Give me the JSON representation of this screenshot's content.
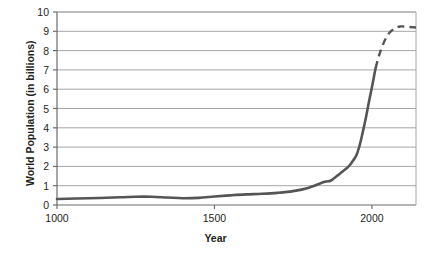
{
  "chart_data": {
    "type": "line",
    "title": "",
    "xlabel": "Year",
    "ylabel": "World Population (in billions)",
    "xlim": [
      1000,
      2140
    ],
    "ylim": [
      0,
      10
    ],
    "grid": true,
    "legend": "none",
    "line_color": "#555555",
    "grid_color": "#a6a6a6",
    "axis_color": "#808080",
    "x_ticks": [
      1000,
      1500,
      2000
    ],
    "x_tick_labels": [
      "1000",
      "1500",
      "2000"
    ],
    "y_ticks": [
      0,
      1,
      2,
      3,
      4,
      5,
      6,
      7,
      8,
      9,
      10
    ],
    "y_tick_labels": [
      "0",
      "1",
      "2",
      "3",
      "4",
      "5",
      "6",
      "7",
      "8",
      "9",
      "10"
    ],
    "series": [
      {
        "name": "Historical world population",
        "style": "solid",
        "x": [
          1000,
          1100,
          1200,
          1250,
          1300,
          1350,
          1400,
          1450,
          1500,
          1550,
          1600,
          1650,
          1700,
          1750,
          1800,
          1850,
          1870,
          1900,
          1920,
          1930,
          1940,
          1950,
          1960,
          1970,
          1980,
          1990,
          2000,
          2010,
          2012
        ],
        "y": [
          0.31,
          0.35,
          0.4,
          0.43,
          0.43,
          0.39,
          0.35,
          0.37,
          0.44,
          0.5,
          0.55,
          0.58,
          0.63,
          0.72,
          0.9,
          1.2,
          1.27,
          1.65,
          1.9,
          2.07,
          2.3,
          2.55,
          3.03,
          3.7,
          4.45,
          5.3,
          6.1,
          6.95,
          7.1
        ]
      },
      {
        "name": "Projected world population",
        "style": "dashed",
        "x": [
          2012,
          2020,
          2030,
          2040,
          2050,
          2060,
          2070,
          2080,
          2090,
          2100,
          2140
        ],
        "y": [
          7.1,
          7.6,
          8.1,
          8.5,
          8.8,
          9.0,
          9.12,
          9.2,
          9.25,
          9.25,
          9.2
        ]
      }
    ]
  },
  "axes": {
    "y_title": "World Population (in billions)",
    "x_title": "Year"
  }
}
